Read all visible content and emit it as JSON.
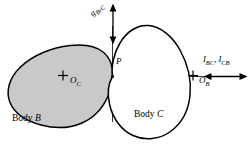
{
  "figure": {
    "background_color": "#ffffff",
    "stroke_color": "#000000",
    "body_b_fill": "#c9c9c9",
    "body_c_fill": "#ffffff",
    "axis_color": "#000000"
  },
  "bodies": {
    "b": {
      "label_prefix": "Body ",
      "label_symbol": "B",
      "center_marker": "+",
      "center_label": "O",
      "center_subscript": "C"
    },
    "c": {
      "label_prefix": "Body ",
      "label_symbol": "C",
      "center_marker": "+",
      "center_label": "O",
      "center_subscript": "B"
    }
  },
  "contact_point": {
    "label": "P"
  },
  "annotations": {
    "gap_arrow": {
      "label_main": "g",
      "label_sub_1": "B",
      "label_sub_2": "r",
      "label_sub_3": "C",
      "full_text": "gʙᵣᴄ",
      "direction": "vertical-double"
    },
    "force_arrow": {
      "label_1": "I",
      "label_1_sub": "BC",
      "separator": ", ",
      "label_2": "I",
      "label_2_sub": "CB",
      "direction": "horizontal-double"
    }
  }
}
